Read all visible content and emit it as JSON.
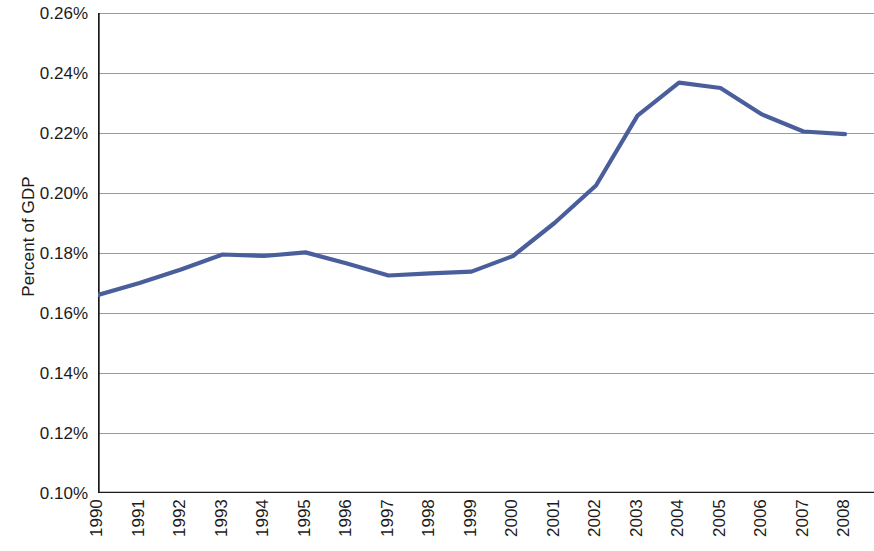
{
  "chart_data": {
    "type": "line",
    "title": "",
    "subtitle": "",
    "xlabel": "",
    "ylabel": "Percent of GDP",
    "legend": [],
    "legend_position": "none",
    "grid": true,
    "grid_axis": "y",
    "line_color": "#4a5e9c",
    "axis_color": "#1a1a1a",
    "gridline_color": "#9a9a9a",
    "x": [
      "1990",
      "1991",
      "1992",
      "1993",
      "1994",
      "1995",
      "1996",
      "1997",
      "1998",
      "1999",
      "2000",
      "2001",
      "2002",
      "2003",
      "2004",
      "2005",
      "2006",
      "2007",
      "2008"
    ],
    "x_tick_labels": [
      "1990",
      "1991",
      "1992",
      "1993",
      "1994",
      "1995",
      "1996",
      "1997",
      "1998",
      "1999",
      "2000",
      "2001",
      "2002",
      "2003",
      "2004",
      "2005",
      "2006",
      "2007",
      "2008"
    ],
    "values": [
      0.166,
      0.17,
      0.1745,
      0.1795,
      0.179,
      0.1802,
      0.1765,
      0.1725,
      0.1732,
      0.1738,
      0.179,
      0.19,
      0.2025,
      0.2258,
      0.2368,
      0.235,
      0.2262,
      0.2205,
      0.2196
    ],
    "value_unit": "%",
    "series": [
      {
        "name": "Percent of GDP",
        "values": [
          0.166,
          0.17,
          0.1745,
          0.1795,
          0.179,
          0.1802,
          0.1765,
          0.1725,
          0.1732,
          0.1738,
          0.179,
          0.19,
          0.2025,
          0.2258,
          0.2368,
          0.235,
          0.2262,
          0.2205,
          0.2196
        ]
      }
    ],
    "ylim": [
      0.1,
      0.26
    ],
    "ytick_step": 0.02,
    "y_tick_labels": [
      "0.26%",
      "0.24%",
      "0.22%",
      "0.20%",
      "0.18%",
      "0.16%",
      "0.14%",
      "0.12%",
      "0.10%"
    ],
    "y_tick_values": [
      0.26,
      0.24,
      0.22,
      0.2,
      0.18,
      0.16,
      0.14,
      0.12,
      0.1
    ]
  }
}
